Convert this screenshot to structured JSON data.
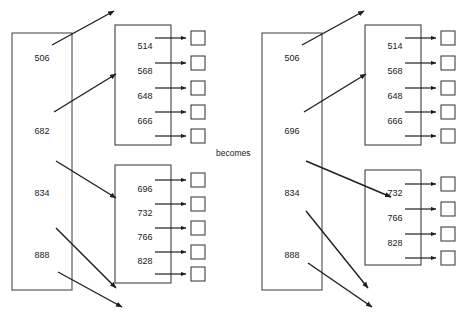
{
  "diagram": {
    "caption": "becomes",
    "colors": {
      "line": "#2e2e2e",
      "arrow": "#1f1f1f",
      "text": "#1a1a1a",
      "background": "#ffffff"
    },
    "before": {
      "parent_node": {
        "label": "parent-node-before",
        "keys": [
          "506",
          "682",
          "834",
          "888"
        ]
      },
      "child_upper": {
        "label": "child-node-upper-before",
        "keys": [
          "514",
          "568",
          "648",
          "666"
        ],
        "pointer_count": 5
      },
      "child_lower": {
        "label": "child-node-lower-before",
        "keys": [
          "696",
          "732",
          "766",
          "828"
        ],
        "pointer_count": 5
      }
    },
    "after": {
      "parent_node": {
        "label": "parent-node-after",
        "keys": [
          "506",
          "696",
          "834",
          "888"
        ]
      },
      "child_upper": {
        "label": "child-node-upper-after",
        "keys": [
          "514",
          "568",
          "648",
          "666"
        ],
        "pointer_count": 5
      },
      "child_lower": {
        "label": "child-node-lower-after",
        "keys": [
          "732",
          "766",
          "828"
        ],
        "pointer_count": 4
      }
    }
  }
}
